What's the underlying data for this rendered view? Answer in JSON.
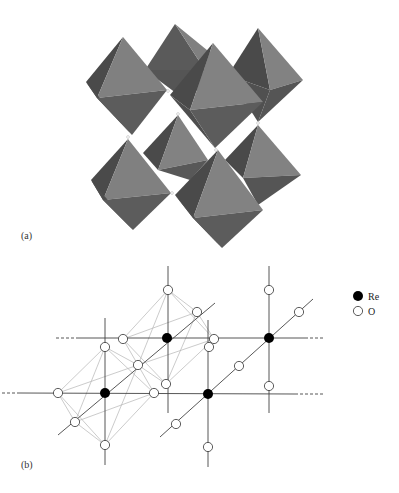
{
  "figure": {
    "panel_a": {
      "label": "(a)",
      "description": "ReO6 octahedra network",
      "colors": {
        "light_face": "#808080",
        "dark_face": "#4a4a4a",
        "mid_face": "#5e5e5e",
        "link_atom": "#ffffff"
      }
    },
    "panel_b": {
      "label": "(b)",
      "legend": [
        {
          "symbol": "filled-circle",
          "label": "Re",
          "color": "#000000"
        },
        {
          "symbol": "open-circle",
          "label": "O",
          "color": "#ffffff"
        }
      ],
      "atoms": {
        "Re": [
          [
            167,
            338
          ],
          [
            105,
            393
          ],
          [
            269,
            338
          ],
          [
            208,
            394
          ]
        ],
        "O": [
          [
            168,
            290
          ],
          [
            197,
            312
          ],
          [
            123,
            339
          ],
          [
            214,
            339
          ],
          [
            105,
            347
          ],
          [
            209,
            347
          ],
          [
            138,
            365
          ],
          [
            166,
            384
          ],
          [
            58,
            393
          ],
          [
            154,
            393
          ],
          [
            75,
            422
          ],
          [
            105,
            445
          ],
          [
            269,
            290
          ],
          [
            299,
            312
          ],
          [
            239,
            366
          ],
          [
            269,
            386
          ],
          [
            176,
            424
          ],
          [
            208,
            447
          ]
        ]
      },
      "colors": {
        "bond": "#444444",
        "octahedron_edge": "#b0b0b0"
      }
    }
  }
}
